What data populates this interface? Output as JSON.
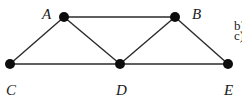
{
  "graph": {
    "nodes": [
      {
        "id": "A",
        "label": "A",
        "x": 64,
        "y": 17,
        "lx": 46,
        "ly": 19
      },
      {
        "id": "B",
        "label": "B",
        "x": 175,
        "y": 17,
        "lx": 193,
        "ly": 19
      },
      {
        "id": "C",
        "label": "C",
        "x": 10,
        "y": 64,
        "lx": 8,
        "ly": 94
      },
      {
        "id": "D",
        "label": "D",
        "x": 120,
        "y": 64,
        "lx": 118,
        "ly": 94
      },
      {
        "id": "E",
        "label": "E",
        "x": 228,
        "y": 64,
        "lx": 225,
        "ly": 94
      }
    ],
    "edges": [
      [
        "A",
        "B"
      ],
      [
        "A",
        "C"
      ],
      [
        "A",
        "D"
      ],
      [
        "B",
        "D"
      ],
      [
        "B",
        "E"
      ],
      [
        "C",
        "D"
      ],
      [
        "D",
        "E"
      ]
    ]
  },
  "side_text": {
    "b": "b)",
    "c": "c)"
  }
}
